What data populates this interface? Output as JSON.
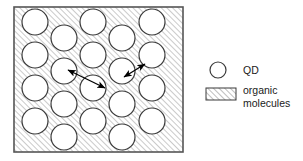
{
  "figure": {
    "type": "schematic-diagram",
    "title": "",
    "background_color": "#ffffff"
  },
  "panel": {
    "name": "qd-organic-matrix-panel",
    "x": 14,
    "y": 7,
    "width": 169,
    "height": 145,
    "border_color": "#555555",
    "border_width": 1.6,
    "fill": "hatch",
    "hatch": {
      "angle_deg": 45,
      "direction": "lower-left-to-upper-right",
      "spacing_px": 4,
      "line_color": "#8a8a8a",
      "line_width": 0.9,
      "background_color": "#ffffff"
    }
  },
  "quantum_dots": {
    "count": 20,
    "radius": 13,
    "fill_color": "#ffffff",
    "stroke_color": "#3a3a3a",
    "stroke_width": 1.2,
    "positions": [
      {
        "cx": 35,
        "cy": 22
      },
      {
        "cx": 35,
        "cy": 55
      },
      {
        "cx": 35,
        "cy": 88
      },
      {
        "cx": 35,
        "cy": 121
      },
      {
        "cx": 64,
        "cy": 38
      },
      {
        "cx": 64,
        "cy": 71
      },
      {
        "cx": 64,
        "cy": 104
      },
      {
        "cx": 64,
        "cy": 137
      },
      {
        "cx": 93,
        "cy": 22
      },
      {
        "cx": 93,
        "cy": 55
      },
      {
        "cx": 93,
        "cy": 88
      },
      {
        "cx": 93,
        "cy": 121
      },
      {
        "cx": 122,
        "cy": 38
      },
      {
        "cx": 122,
        "cy": 71
      },
      {
        "cx": 122,
        "cy": 104
      },
      {
        "cx": 122,
        "cy": 137
      },
      {
        "cx": 152,
        "cy": 22
      },
      {
        "cx": 152,
        "cy": 55
      },
      {
        "cx": 152,
        "cy": 88
      },
      {
        "cx": 152,
        "cy": 121
      }
    ]
  },
  "arrows": [
    {
      "name": "long-transfer-arrow",
      "x1": 68,
      "y1": 70,
      "x2": 105,
      "y2": 88,
      "double_headed": true,
      "color": "#000000",
      "width": 1.3
    },
    {
      "name": "short-transfer-arrow",
      "x1": 124,
      "y1": 77,
      "x2": 145,
      "y2": 64,
      "double_headed": true,
      "color": "#000000",
      "width": 1.3
    }
  ],
  "legend": {
    "name": "figure-legend",
    "items": [
      {
        "key": "qd",
        "symbol": "circle",
        "label": "QD",
        "symbol_cx": 218,
        "symbol_cy": 70,
        "symbol_r": 8,
        "label_x": 243,
        "label_y": 74
      },
      {
        "key": "organic-molecules",
        "symbol": "hatched-rect",
        "label_line_1": "organic",
        "label_line_2": "molecules",
        "symbol_x": 206,
        "symbol_y": 88,
        "symbol_width": 30,
        "symbol_height": 12,
        "label_x": 243,
        "label_y_1": 94,
        "label_y_2": 107
      }
    ]
  },
  "colors": {
    "ink": "#1a1a1a",
    "panel_border": "#555555",
    "hatch_line": "#8a8a8a",
    "dot_stroke": "#3a3a3a",
    "dot_fill": "#ffffff"
  }
}
